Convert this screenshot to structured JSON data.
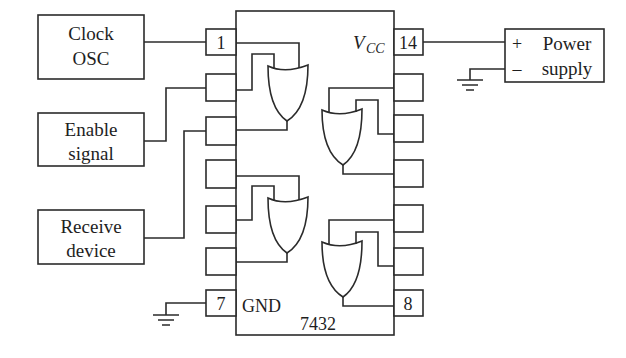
{
  "diagram": {
    "type": "circuit-wiring",
    "chip": {
      "part_number": "7432",
      "vcc_label": "V",
      "vcc_subscript": "CC",
      "gnd_label": "GND",
      "pins_left": [
        "1",
        "",
        "",
        "",
        "",
        "",
        "7"
      ],
      "pins_right": [
        "14",
        "",
        "",
        "",
        "",
        "",
        "8"
      ],
      "gate_type": "OR",
      "gate_count": 4
    },
    "blocks": {
      "clock": {
        "line1": "Clock",
        "line2": "OSC"
      },
      "enable": {
        "line1": "Enable",
        "line2": "signal"
      },
      "receive": {
        "line1": "Receive",
        "line2": "device"
      },
      "power": {
        "plus": "+",
        "minus": "–",
        "line1": "Power",
        "line2": "supply"
      }
    },
    "connections": [
      {
        "from": "Clock OSC",
        "to": "pin 1"
      },
      {
        "from": "Enable signal",
        "to": "pin 2"
      },
      {
        "from": "Receive device",
        "to": "pin 3"
      },
      {
        "from": "pin 7",
        "to": "ground"
      },
      {
        "from": "pin 14",
        "to": "Power supply +"
      },
      {
        "from": "Power supply –",
        "to": "ground"
      }
    ]
  }
}
